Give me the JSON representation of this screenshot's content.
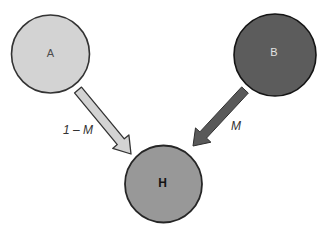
{
  "figure": {
    "background": "#ffffff",
    "nodes": {
      "a": {
        "label": "A",
        "fill": "#d3d3d3",
        "stroke": "#333333",
        "label_color": "#4d4d4d"
      },
      "b": {
        "label": "B",
        "fill": "#5c5c5c",
        "stroke": "#141414",
        "label_color": "#e3e3e3"
      },
      "h": {
        "label": "H",
        "fill": "#989898",
        "stroke": "#262626",
        "label_color": "#141414"
      }
    },
    "edges": {
      "a_to_h": {
        "label": "1 – M",
        "fill": "#d3d3d3",
        "stroke": "#333333",
        "label_color": "#333333"
      },
      "b_to_h": {
        "label": "M",
        "fill": "#595959",
        "stroke": "#2e2e2e",
        "label_color": "#333333"
      }
    }
  }
}
